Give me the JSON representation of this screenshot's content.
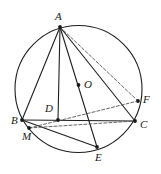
{
  "figure": {
    "kind": "geometry-diagram",
    "width": 161,
    "height": 174,
    "background_color": "#ffffff",
    "stroke_color": "#1f1f1f",
    "dashed_stroke_color": "#555555",
    "point_color": "#1a1a1a"
  },
  "circle": {
    "name": "circumcircle",
    "center_label": "O",
    "cx": 78.5,
    "cy": 89,
    "r": 63.5,
    "stroke": "#1f1f1f",
    "stroke_width": 1.1,
    "fill": "none"
  },
  "points": [
    {
      "id": "A",
      "label": "A",
      "x": 60,
      "y": 27,
      "label_x": 55,
      "label_y": 11,
      "marked": true
    },
    {
      "id": "O",
      "label": "O",
      "x": 78.5,
      "y": 85,
      "label_x": 84,
      "label_y": 79,
      "marked": true
    },
    {
      "id": "D",
      "label": "D",
      "x": 58,
      "y": 120,
      "label_x": 45,
      "label_y": 103,
      "marked": true
    },
    {
      "id": "B",
      "label": "B",
      "x": 22,
      "y": 120,
      "label_x": 11,
      "label_y": 115,
      "marked": true
    },
    {
      "id": "C",
      "label": "C",
      "x": 135,
      "y": 121,
      "label_x": 140,
      "label_y": 119,
      "marked": true
    },
    {
      "id": "F",
      "label": "F",
      "x": 138,
      "y": 101,
      "label_x": 143,
      "label_y": 94,
      "marked": true
    },
    {
      "id": "M",
      "label": "M",
      "x": 29,
      "y": 128,
      "label_x": 22,
      "label_y": 131,
      "marked": true
    },
    {
      "id": "E",
      "label": "E",
      "x": 97,
      "y": 147,
      "label_x": 95,
      "label_y": 152,
      "marked": true
    }
  ],
  "solid_segments": [
    {
      "name": "segment-AB",
      "from": "A",
      "to": "B"
    },
    {
      "name": "segment-AD",
      "from": "A",
      "to": "D"
    },
    {
      "name": "segment-AE",
      "from": "A",
      "to": "E"
    },
    {
      "name": "segment-AC",
      "from": "A",
      "to": "C"
    },
    {
      "name": "segment-BC",
      "from": "B",
      "to": "C"
    },
    {
      "name": "segment-BE",
      "from": "B",
      "to": "E"
    }
  ],
  "dashed_segments": [
    {
      "name": "segment-AF",
      "from": "A",
      "to": "F"
    },
    {
      "name": "segment-MC",
      "from": "M",
      "to": "C"
    },
    {
      "name": "segment-MF",
      "from": "M",
      "to": "F"
    }
  ],
  "labels": {
    "A": "A",
    "B": "B",
    "C": "C",
    "D": "D",
    "E": "E",
    "F": "F",
    "M": "M",
    "O": "O"
  }
}
